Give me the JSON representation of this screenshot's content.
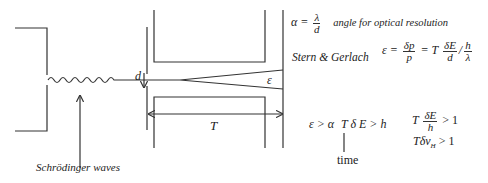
{
  "diagram": {
    "labels": {
      "slit_width": "d",
      "magnet_length": "T",
      "deflection_angle": "ε",
      "waves_caption": "Schrödinger waves"
    },
    "equations": {
      "alpha_lhs": "α =",
      "alpha_num": "λ",
      "alpha_den": "d",
      "alpha_note": "angle for optical resolution",
      "sg_label": "Stern & Gerlach",
      "eps_lhs": "ε =",
      "eps_f1_num": "δp",
      "eps_f1_den": "p",
      "eps_mid": "= T",
      "eps_f2_num": "δE",
      "eps_f2_den": "d",
      "eps_slash": "/",
      "eps_f3_num": "h",
      "eps_f3_den": "λ",
      "cond1": "ε > α",
      "cond2": "T δ E > h",
      "time_label": "time",
      "cond3_T": "T",
      "cond3_num": "δE",
      "cond3_den": "h",
      "cond3_rhs": "> 1",
      "cond4_main": "Tδν",
      "cond4_sub": "H",
      "cond4_rhs": "> 1"
    },
    "colors": {
      "stroke": "#333333",
      "background": "#ffffff"
    }
  }
}
